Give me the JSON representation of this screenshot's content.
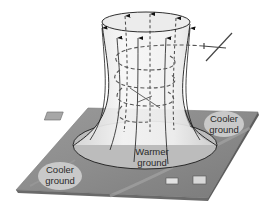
{
  "diagram": {
    "labels": {
      "cooler_left_line1": "Cooler",
      "cooler_left_line2": "ground",
      "cooler_right_line1": "Cooler",
      "cooler_right_line2": "ground",
      "warmer_line1": "Warmer",
      "warmer_line2": "ground"
    },
    "elements": {
      "ground_plane": "ground-plane",
      "thermal_column": "rising-air-column",
      "updraft_arrows": 7,
      "glider_path": "dashed-spiral",
      "gliders": 2,
      "buildings": 3
    },
    "colors": {
      "ground": "#8e8e8e",
      "ground_light": "#b4b4b4",
      "warm_zone": "#bdbdbd",
      "label_bubble": "#c8c8c8",
      "column_fill": "#f4f4f4",
      "line": "#1a1a1a",
      "background": "#ffffff"
    }
  }
}
